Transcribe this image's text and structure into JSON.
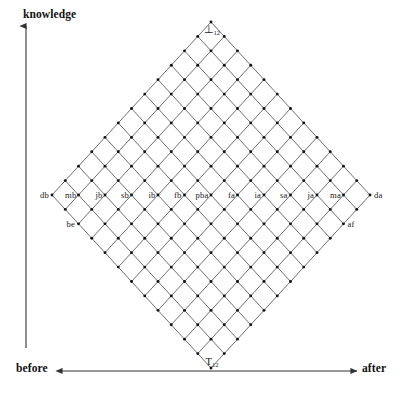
{
  "axes": {
    "vertical": {
      "label": "knowledge",
      "direction": "up"
    },
    "horizontal_left": {
      "label": "before",
      "direction": "left"
    },
    "horizontal_right": {
      "label": "after",
      "direction": "right"
    }
  },
  "lattice": {
    "size": 12,
    "top_vertex": {
      "base": "T",
      "sub": "12",
      "text": "T12"
    },
    "bottom_vertex": {
      "base": "⊥",
      "sub": "12",
      "text": "⊥12"
    },
    "middle_row_labels": [
      "db",
      "mb",
      "jb",
      "sb",
      "ib",
      "fb",
      "pba",
      "fa",
      "ia",
      "sa",
      "ja",
      "ma",
      "da"
    ],
    "extra_labels": [
      {
        "text": "be",
        "side": "left"
      },
      {
        "text": "af",
        "side": "right"
      }
    ]
  },
  "colors": {
    "line": "#555555",
    "node": "#111111",
    "axis": "#333333",
    "text": "#1a1a1a",
    "background": "#ffffff"
  },
  "chart_data": {
    "type": "scatter",
    "title": "",
    "xlabel": "before ↔ after",
    "ylabel": "knowledge",
    "grid": true,
    "legend": null,
    "n_rows": 12,
    "n_cols": 12,
    "categories": [
      "db",
      "mb",
      "jb",
      "sb",
      "ib",
      "fb",
      "pba",
      "fa",
      "ia",
      "sa",
      "ja",
      "ma",
      "da"
    ],
    "values": [
      0,
      0,
      0,
      0,
      0,
      0,
      0,
      0,
      0,
      0,
      0,
      0,
      0
    ],
    "annotations": [
      "T12",
      "⊥12",
      "be",
      "af"
    ],
    "xlim": [
      -6,
      6
    ],
    "ylim": [
      -6,
      6
    ]
  }
}
